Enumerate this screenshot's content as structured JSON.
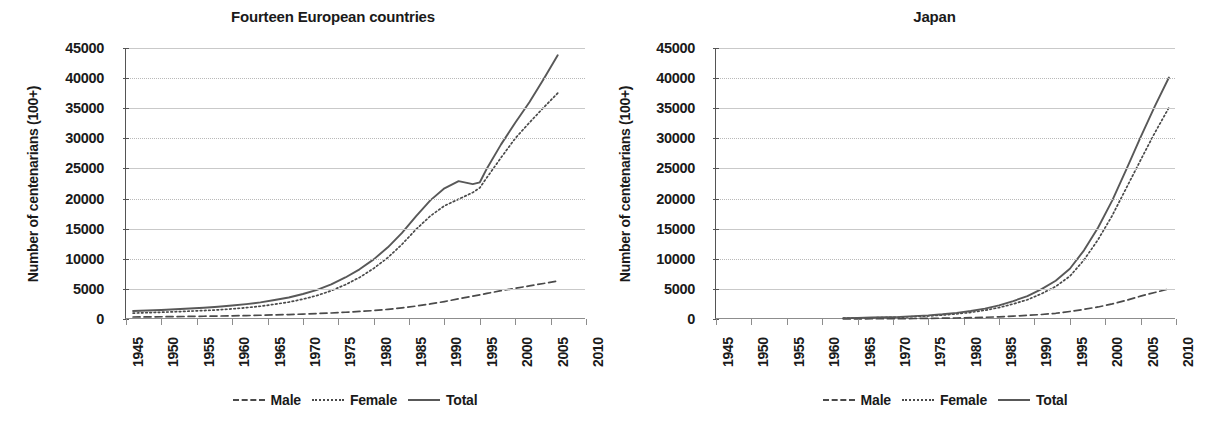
{
  "figure": {
    "ylabel": "Number of centenarians (100+)",
    "legend": [
      {
        "name": "Male",
        "style": "dashed"
      },
      {
        "name": "Female",
        "style": "dotted"
      },
      {
        "name": "Total",
        "style": "solid"
      }
    ],
    "colors": {
      "male": "#4a4a4a",
      "female": "#4a4a4a",
      "total": "#585858",
      "grid": "#b9b9b9",
      "axis": "#555555"
    },
    "ylim": [
      0,
      45000
    ],
    "yticks": [
      0,
      5000,
      10000,
      15000,
      20000,
      25000,
      30000,
      35000,
      40000,
      45000
    ],
    "xlim": [
      1945,
      2010
    ],
    "xticks": [
      1945,
      1950,
      1955,
      1960,
      1965,
      1970,
      1975,
      1980,
      1985,
      1990,
      1995,
      2000,
      2005,
      2010
    ]
  },
  "chart_data": [
    {
      "type": "line",
      "title": "Fourteen European countries",
      "xlabel": "",
      "ylabel": "Number of centenarians (100+)",
      "xlim": [
        1945,
        2010
      ],
      "ylim": [
        0,
        45000
      ],
      "grid": true,
      "legend_position": "bottom",
      "x": [
        1946,
        1948,
        1950,
        1952,
        1954,
        1956,
        1958,
        1960,
        1962,
        1964,
        1966,
        1968,
        1970,
        1972,
        1974,
        1976,
        1978,
        1980,
        1982,
        1984,
        1986,
        1988,
        1990,
        1992,
        1994,
        1995,
        1996,
        1998,
        2000,
        2002,
        2004,
        2006
      ],
      "series": [
        {
          "name": "Male",
          "style": "dashed",
          "values": [
            330,
            350,
            370,
            400,
            430,
            460,
            490,
            530,
            570,
            620,
            680,
            740,
            820,
            900,
            1000,
            1120,
            1250,
            1400,
            1600,
            1850,
            2150,
            2500,
            2900,
            3350,
            3800,
            4000,
            4250,
            4700,
            5100,
            5500,
            5900,
            6300
          ]
        },
        {
          "name": "Female",
          "style": "dotted",
          "values": [
            980,
            1050,
            1120,
            1200,
            1300,
            1400,
            1520,
            1680,
            1880,
            2120,
            2450,
            2800,
            3300,
            3900,
            4700,
            5700,
            6900,
            8400,
            10200,
            12400,
            14900,
            17100,
            18800,
            19900,
            21000,
            21800,
            23500,
            26800,
            30000,
            32600,
            35100,
            37500
          ]
        },
        {
          "name": "Total",
          "style": "solid",
          "values": [
            1320,
            1400,
            1500,
            1620,
            1750,
            1880,
            2030,
            2230,
            2470,
            2760,
            3150,
            3570,
            4150,
            4850,
            5750,
            6900,
            8250,
            9900,
            11900,
            14300,
            17100,
            19700,
            21700,
            22900,
            22400,
            22700,
            25000,
            29000,
            32600,
            36000,
            39800,
            43800
          ]
        }
      ]
    },
    {
      "type": "line",
      "title": "Japan",
      "xlabel": "",
      "ylabel": "Number of centenarians (100+)",
      "xlim": [
        1945,
        2010
      ],
      "ylim": [
        0,
        45000
      ],
      "grid": true,
      "legend_position": "bottom",
      "x": [
        1963,
        1965,
        1967,
        1969,
        1971,
        1973,
        1975,
        1977,
        1979,
        1981,
        1983,
        1985,
        1987,
        1989,
        1991,
        1993,
        1995,
        1997,
        1999,
        2001,
        2003,
        2005,
        2007,
        2009
      ],
      "series": [
        {
          "name": "Male",
          "style": "dashed",
          "values": [
            20,
            30,
            40,
            50,
            60,
            80,
            100,
            130,
            170,
            220,
            280,
            360,
            480,
            600,
            750,
            950,
            1250,
            1600,
            2000,
            2500,
            3100,
            3800,
            4400,
            5000
          ]
        },
        {
          "name": "Female",
          "style": "dotted",
          "values": [
            130,
            160,
            200,
            250,
            300,
            400,
            500,
            650,
            850,
            1100,
            1450,
            1900,
            2500,
            3200,
            4200,
            5400,
            7100,
            9800,
            13200,
            17200,
            21800,
            26400,
            30900,
            35100
          ]
        },
        {
          "name": "Total",
          "style": "solid",
          "values": [
            150,
            190,
            240,
            300,
            360,
            480,
            600,
            780,
            1020,
            1320,
            1730,
            2260,
            2980,
            3800,
            4950,
            6350,
            8350,
            11400,
            15200,
            19700,
            24900,
            30200,
            35300,
            40100
          ]
        }
      ]
    }
  ]
}
